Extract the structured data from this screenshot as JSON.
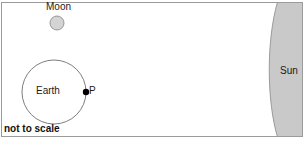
{
  "diagram": {
    "caption": "not to scale",
    "bodies": [
      {
        "key": "moon",
        "label": "Moon",
        "shape": "circle",
        "fill_color": "#d4d4d4",
        "stroke_color": "#8c8c8c",
        "center_x": 57,
        "center_y": 23,
        "radius": 7
      },
      {
        "key": "earth",
        "label": "Earth",
        "shape": "circle",
        "fill_color": "#ffffff",
        "stroke_color": "#6e6e6e",
        "center_x": 54,
        "center_y": 92,
        "radius": 32
      },
      {
        "key": "sun",
        "label": "Sun",
        "shape": "arc-limb",
        "fill_color": "#c9c9c9",
        "stroke_color": "#9a9a9a",
        "left_edge_top_x": 277,
        "left_edge_middle_x": 266,
        "left_edge_bottom_x": 277
      }
    ],
    "markers": [
      {
        "key": "point-p",
        "label": "P",
        "shape": "dot",
        "fill_color": "#000000",
        "center_x": 86,
        "center_y": 92,
        "radius": 3.2,
        "description": "point on Earth surface facing the Sun"
      }
    ],
    "frame": {
      "border_color": "#9b9b9b",
      "background_color": "#ffffff",
      "x": 1,
      "y": 2,
      "width": 302,
      "height": 135
    }
  }
}
